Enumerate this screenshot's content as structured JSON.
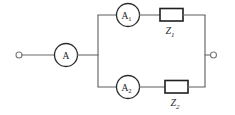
{
  "diagram": {
    "background_color": "#ffffff",
    "wire_color": "#6b6b6b",
    "component_color": "#1f1f1f",
    "label_color": "#1a1a1a"
  },
  "terminals": {
    "left": {
      "name": "left-terminal",
      "symbol": "o"
    },
    "right": {
      "name": "right-terminal",
      "symbol": "o"
    }
  },
  "meters": [
    {
      "id": "main",
      "label": "A",
      "subscript": ""
    },
    {
      "id": "branch1",
      "label": "A",
      "subscript": "1"
    },
    {
      "id": "branch2",
      "label": "A",
      "subscript": "2"
    }
  ],
  "impedances": [
    {
      "id": "z1",
      "label": "Z",
      "subscript": "1"
    },
    {
      "id": "z2",
      "label": "Z",
      "subscript": "2"
    }
  ]
}
